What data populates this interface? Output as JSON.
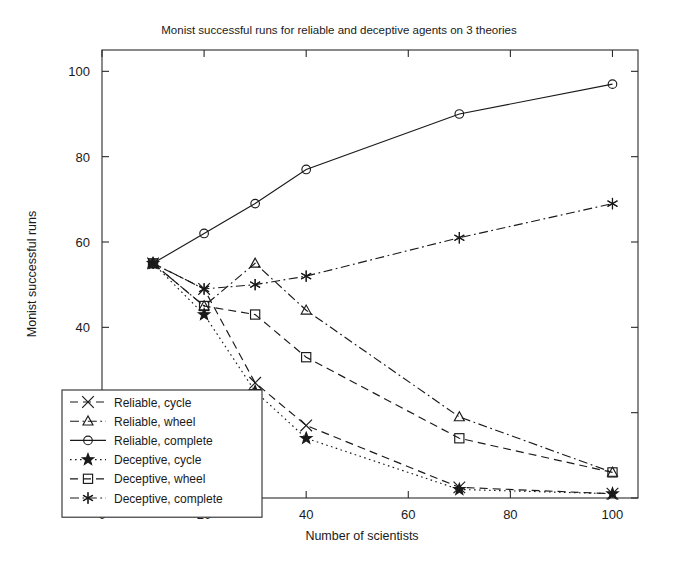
{
  "chart_data": {
    "type": "line",
    "title": "Monist successful runs for reliable and deceptive agents on 3 theories",
    "xlabel": "Number of scientists",
    "ylabel": "Monist successful runs",
    "xlim": [
      0,
      105
    ],
    "ylim": [
      0,
      105
    ],
    "xticks": [
      0,
      20,
      40,
      60,
      80,
      100
    ],
    "yticks": [
      0,
      20,
      40,
      60,
      80,
      100
    ],
    "xtick_labels": [
      "0",
      "20",
      "40",
      "60",
      "80",
      "100"
    ],
    "ytick_labels": [
      "0",
      "20",
      "40",
      "60",
      "80",
      "100"
    ],
    "grid": false,
    "legend_position": "lower-left",
    "x": [
      10,
      20,
      30,
      40,
      70,
      100
    ],
    "series": [
      {
        "name": "Reliable, cycle",
        "marker": "x-cross",
        "linestyle": "dashed",
        "color": "#1a1a1a",
        "values": [
          55,
          49,
          27,
          17,
          2.5,
          1
        ]
      },
      {
        "name": "Reliable, wheel",
        "marker": "triangle",
        "linestyle": "dash-dot",
        "color": "#1a1a1a",
        "values": [
          55,
          45,
          55,
          44,
          19,
          6
        ]
      },
      {
        "name": "Reliable, complete",
        "marker": "circle",
        "linestyle": "solid",
        "color": "#1a1a1a",
        "values": [
          55,
          62,
          69,
          77,
          90,
          97
        ]
      },
      {
        "name": "Deceptive, cycle",
        "marker": "star",
        "linestyle": "dotted",
        "color": "#1a1a1a",
        "values": [
          55,
          43,
          25,
          14,
          2,
          1
        ]
      },
      {
        "name": "Deceptive, wheel",
        "marker": "square",
        "linestyle": "dashed",
        "color": "#1a1a1a",
        "values": [
          55,
          45,
          43,
          33,
          14,
          6
        ]
      },
      {
        "name": "Deceptive, complete",
        "marker": "asterisk",
        "linestyle": "dash-dot",
        "color": "#1a1a1a",
        "values": [
          55,
          49,
          50,
          52,
          61,
          69
        ]
      }
    ]
  },
  "legend": {
    "items": [
      "Reliable, cycle",
      "Reliable, wheel",
      "Reliable, complete",
      "Deceptive, cycle",
      "Deceptive, wheel",
      "Deceptive, complete"
    ]
  }
}
